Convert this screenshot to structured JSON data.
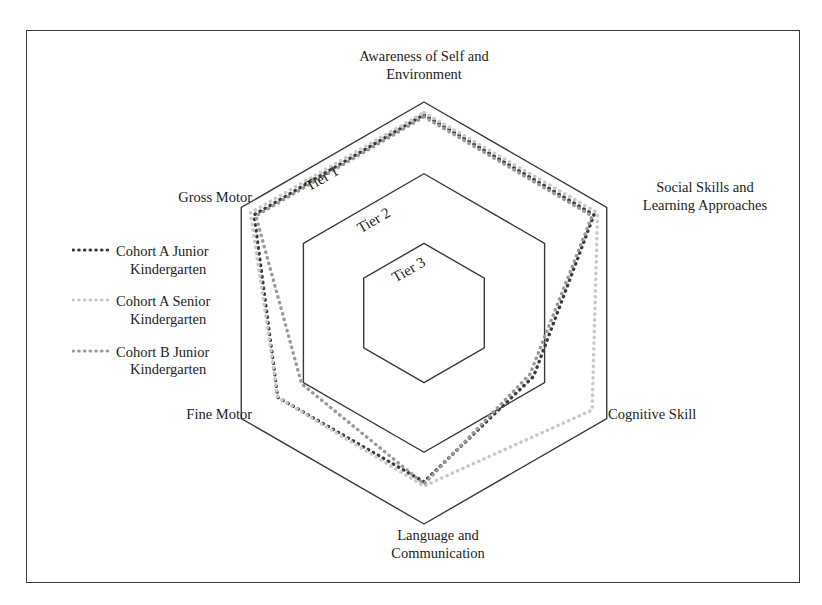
{
  "figure": {
    "type": "radar-hexagon",
    "background": "#ffffff",
    "frame_color": "#3a3a3a"
  },
  "chart_data": {
    "type": "radar",
    "title": "",
    "subtitle": "",
    "xlabel": "",
    "ylabel": "",
    "grid": true,
    "legend_position": "left",
    "shape": "hexagon",
    "axes": [
      "Awareness of Self and Environment",
      "Social Skills and Learning Approaches",
      "Cognitive Skill",
      "Language and Communication",
      "Fine Motor",
      "Gross Motor"
    ],
    "rings": [
      {
        "label": "Tier 1",
        "radius": 1.0
      },
      {
        "label": "Tier 2",
        "radius": 0.66
      },
      {
        "label": "Tier 3",
        "radius": 0.33
      }
    ],
    "ring_labels": [
      "Tier 1",
      "Tier 2",
      "Tier 3"
    ],
    "ylim": [
      0,
      1
    ],
    "series": [
      {
        "name": "Cohort A Junior Kindergarten",
        "color": "#3b3b3b",
        "style": "dotted",
        "values": [
          0.94,
          0.93,
          0.6,
          0.8,
          0.8,
          0.93
        ]
      },
      {
        "name": "Cohort A Senior Kindergarten",
        "color": "#c9c9c9",
        "style": "dotted",
        "values": [
          0.95,
          0.95,
          0.92,
          0.82,
          0.8,
          0.95
        ]
      },
      {
        "name": "Cohort B Junior Kindergarten",
        "color": "#9a9a9a",
        "style": "dotted",
        "values": [
          0.93,
          0.92,
          0.58,
          0.81,
          0.67,
          0.92
        ]
      }
    ]
  },
  "axis_labels": {
    "top": {
      "line1": "Awareness of Self and",
      "line2": "Environment"
    },
    "upper_right": {
      "line1": "Social Skills and",
      "line2": "Learning Approaches"
    },
    "lower_right": {
      "line1": "Cognitive Skill",
      "line2": ""
    },
    "bottom": {
      "line1": "Language and",
      "line2": "Communication"
    },
    "lower_left": {
      "line1": "Fine Motor",
      "line2": ""
    },
    "upper_left": {
      "line1": "Gross Motor",
      "line2": ""
    }
  },
  "tiers": {
    "tier1": "Tier 1",
    "tier2": "Tier 2",
    "tier3": "Tier 3"
  },
  "legend": {
    "items": [
      {
        "line1": "Cohort A Junior",
        "line2": "Kindergarten",
        "color": "#3b3b3b"
      },
      {
        "line1": "Cohort A Senior",
        "line2": "Kindergarten",
        "color": "#c9c9c9"
      },
      {
        "line1": "Cohort B Junior",
        "line2": "Kindergarten",
        "color": "#9a9a9a"
      }
    ]
  }
}
